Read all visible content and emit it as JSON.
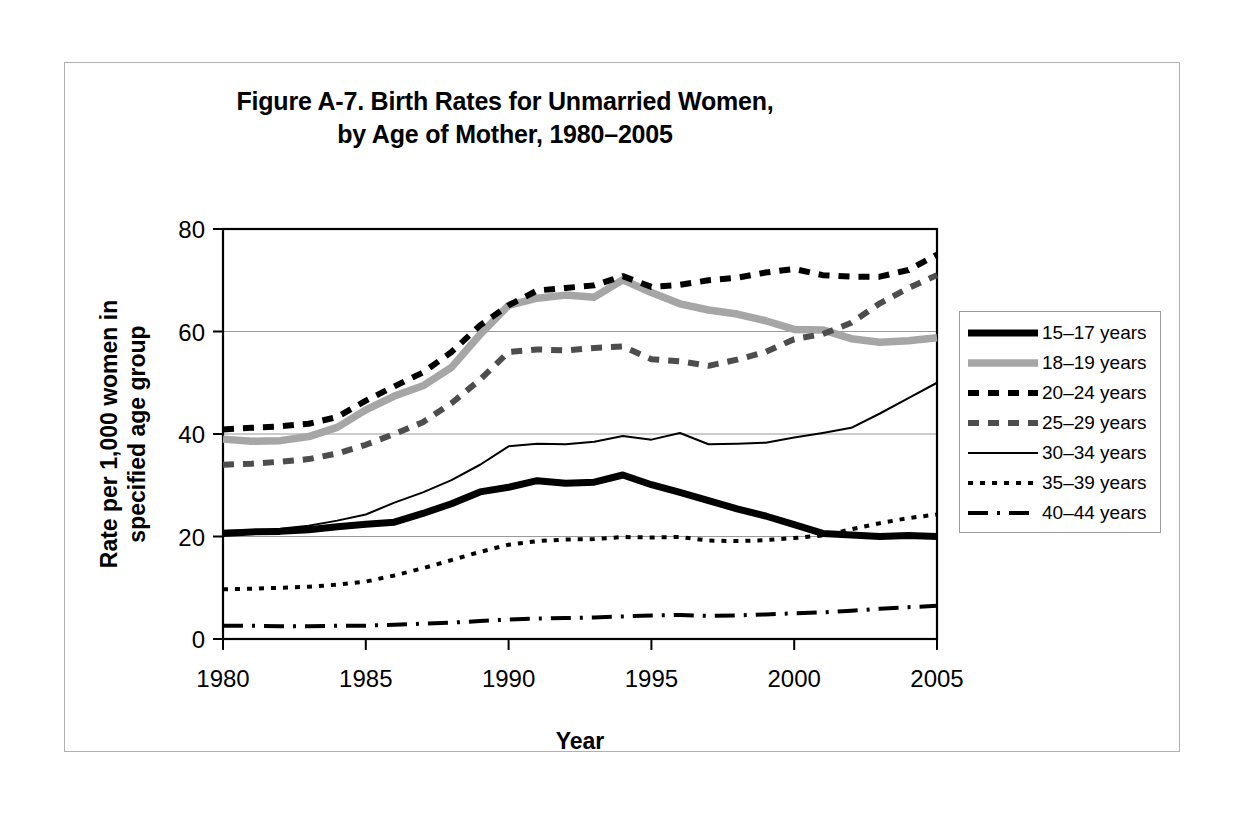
{
  "figure": {
    "title_line1": "Figure A-7. Birth Rates for Unmarried Women,",
    "title_line2": "by Age of Mother, 1980–2005"
  },
  "axes": {
    "x_title": "Year",
    "y_title_line1": "Rate per 1,000 women in",
    "y_title_line2": "specified age group",
    "x_ticks": [
      "1980",
      "1985",
      "1990",
      "1995",
      "2000",
      "2005"
    ],
    "y_ticks": [
      "0",
      "20",
      "40",
      "60",
      "80"
    ]
  },
  "legend": {
    "items": [
      {
        "label": "15–17 years",
        "style": "thick-solid-black",
        "color": "#000000"
      },
      {
        "label": "18–19 years",
        "style": "thick-solid-gray",
        "color": "#a6a6a6"
      },
      {
        "label": "20–24 years",
        "style": "thick-dashed-black",
        "color": "#000000"
      },
      {
        "label": "25–29 years",
        "style": "thick-dashed-gray-dark",
        "color": "#4d4d4d"
      },
      {
        "label": "30–34 years",
        "style": "thin-solid-black",
        "color": "#000000"
      },
      {
        "label": "35–39 years",
        "style": "dotted-black",
        "color": "#000000"
      },
      {
        "label": "40–44 years",
        "style": "dash-dot-black",
        "color": "#000000"
      }
    ]
  },
  "chart_data": {
    "type": "line",
    "title": "Figure A-7. Birth Rates for Unmarried Women, by Age of Mother, 1980–2005",
    "xlabel": "Year",
    "ylabel": "Rate per 1,000 women in specified age group",
    "xlim": [
      1980,
      2005
    ],
    "ylim": [
      0,
      80
    ],
    "ytick_interval": 20,
    "xtick_interval": 5,
    "grid": "horizontal",
    "legend_position": "right",
    "x": [
      1980,
      1981,
      1982,
      1983,
      1984,
      1985,
      1986,
      1987,
      1988,
      1989,
      1990,
      1991,
      1992,
      1993,
      1994,
      1995,
      1996,
      1997,
      1998,
      1999,
      2000,
      2001,
      2002,
      2003,
      2004,
      2005
    ],
    "series": [
      {
        "name": "15–17 years",
        "values": [
          20.6,
          20.9,
          21.0,
          21.3,
          21.9,
          22.4,
          22.8,
          24.5,
          26.4,
          28.7,
          29.6,
          30.9,
          30.4,
          30.6,
          32.0,
          30.1,
          28.6,
          27.0,
          25.4,
          24.0,
          22.3,
          20.6,
          20.3,
          20.0,
          20.2,
          20.0
        ]
      },
      {
        "name": "18–19 years",
        "values": [
          39.0,
          38.6,
          38.7,
          39.5,
          41.3,
          44.7,
          47.4,
          49.4,
          53.0,
          59.4,
          65.1,
          66.5,
          67.1,
          66.7,
          70.1,
          67.6,
          65.4,
          64.2,
          63.4,
          62.1,
          60.4,
          60.3,
          58.6,
          57.9,
          58.2,
          58.8
        ]
      },
      {
        "name": "20–24 years",
        "values": [
          40.9,
          41.2,
          41.5,
          42.0,
          43.3,
          46.5,
          49.3,
          52.0,
          56.0,
          61.2,
          65.1,
          68.0,
          68.5,
          69.0,
          70.8,
          68.7,
          69.1,
          70.0,
          70.5,
          71.5,
          72.2,
          71.0,
          70.7,
          70.7,
          72.0,
          75.0
        ]
      },
      {
        "name": "25–29 years",
        "values": [
          34.0,
          34.2,
          34.6,
          35.1,
          36.2,
          37.9,
          40.0,
          42.3,
          46.0,
          50.6,
          56.0,
          56.5,
          56.3,
          56.8,
          57.1,
          54.6,
          54.2,
          53.3,
          54.5,
          56.0,
          58.5,
          59.5,
          61.7,
          65.5,
          68.5,
          71.0
        ]
      },
      {
        "name": "30–34 years",
        "values": [
          21.1,
          21.2,
          21.5,
          22.1,
          23.1,
          24.3,
          26.6,
          28.6,
          31.0,
          34.0,
          37.6,
          38.1,
          38.0,
          38.5,
          39.6,
          38.9,
          40.2,
          38.0,
          38.1,
          38.3,
          39.3,
          40.2,
          41.2,
          44.0,
          47.0,
          50.0
        ]
      },
      {
        "name": "35–39 years",
        "values": [
          9.7,
          9.8,
          10.0,
          10.2,
          10.6,
          11.2,
          12.4,
          13.8,
          15.4,
          17.0,
          18.4,
          19.1,
          19.4,
          19.5,
          19.9,
          19.8,
          19.9,
          19.2,
          19.1,
          19.3,
          19.7,
          20.2,
          21.4,
          22.6,
          23.6,
          24.3
        ]
      },
      {
        "name": "40–44 years",
        "values": [
          2.6,
          2.6,
          2.5,
          2.5,
          2.6,
          2.6,
          2.8,
          3.0,
          3.2,
          3.5,
          3.8,
          4.0,
          4.1,
          4.2,
          4.4,
          4.6,
          4.7,
          4.5,
          4.6,
          4.8,
          5.0,
          5.2,
          5.5,
          5.9,
          6.2,
          6.5
        ]
      }
    ]
  }
}
